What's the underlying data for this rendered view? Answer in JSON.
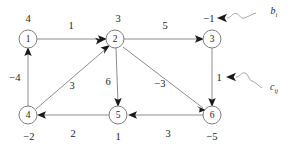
{
  "figure": {
    "type": "directed-network-flow-graph"
  },
  "nodes": [
    {
      "id": "1",
      "label": "1",
      "supply": "4",
      "x": 28,
      "y": 39,
      "supply_x": 28,
      "supply_y": 19
    },
    {
      "id": "2",
      "label": "2",
      "supply": "3",
      "x": 115,
      "y": 39,
      "supply_x": 118,
      "supply_y": 19
    },
    {
      "id": "3",
      "label": "3",
      "supply": "−1",
      "x": 212,
      "y": 39,
      "supply_x": 209,
      "supply_y": 19
    },
    {
      "id": "4",
      "label": "4",
      "supply": "−2",
      "x": 28,
      "y": 115,
      "supply_x": 29,
      "supply_y": 137
    },
    {
      "id": "5",
      "label": "5",
      "supply": "1",
      "x": 118,
      "y": 115,
      "supply_x": 118,
      "supply_y": 137
    },
    {
      "id": "6",
      "label": "6",
      "supply": "−5",
      "x": 212,
      "y": 115,
      "supply_x": 212,
      "supply_y": 137
    }
  ],
  "edges": [
    {
      "from": "1",
      "to": "2",
      "cost": "1",
      "label_x": 71,
      "label_y": 26
    },
    {
      "from": "2",
      "to": "3",
      "cost": "5",
      "label_x": 165,
      "label_y": 26
    },
    {
      "from": "4",
      "to": "1",
      "cost": "−4",
      "label_x": 15,
      "label_y": 78
    },
    {
      "from": "4",
      "to": "2",
      "cost": "3",
      "label_x": 72,
      "label_y": 86
    },
    {
      "from": "2",
      "to": "5",
      "cost": "6",
      "label_x": 108,
      "label_y": 82
    },
    {
      "from": "2",
      "to": "6",
      "cost": "−3",
      "label_x": 160,
      "label_y": 84
    },
    {
      "from": "3",
      "to": "6",
      "cost": "1",
      "label_x": 219,
      "label_y": 78
    },
    {
      "from": "5",
      "to": "4",
      "cost": "2",
      "label_x": 73,
      "label_y": 134
    },
    {
      "from": "6",
      "to": "5",
      "cost": "3",
      "label_x": 168,
      "label_y": 134
    }
  ],
  "annotations": [
    {
      "name": "supply-annotation",
      "text": "b",
      "subscript": "i",
      "x": 274,
      "y": 12
    },
    {
      "name": "cost-annotation",
      "text": "c",
      "subscript": "ij",
      "x": 274,
      "y": 88
    }
  ],
  "colors": {
    "node_stroke": "#7d7d7d",
    "edge_stroke": "#8c8c8c",
    "arrow_fill": "#1a1a1a",
    "text": "#1c1c1c",
    "background": "#ffffff"
  }
}
